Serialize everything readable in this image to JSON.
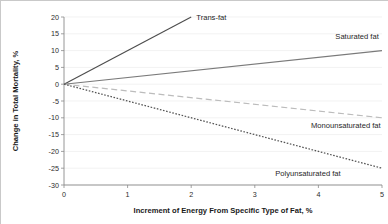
{
  "chart_data": {
    "type": "line",
    "title": "",
    "xlabel": "Increment of Energy From Specific Type of Fat, %",
    "ylabel": "Change in Total Mortality, %",
    "xlim": [
      0,
      5
    ],
    "ylim": [
      -30,
      20
    ],
    "xticks": [
      "0",
      "1",
      "2",
      "3",
      "4",
      "5"
    ],
    "yticks": [
      "20",
      "15",
      "10",
      "5",
      "0",
      "-5",
      "-10",
      "-15",
      "-20",
      "-25",
      "-30"
    ],
    "grid": true,
    "legend_position": "inline-labels",
    "series": [
      {
        "name": "Trans-fat",
        "x": [
          0,
          2
        ],
        "values": [
          0,
          20
        ],
        "style": "solid",
        "color": "#4d4d4d",
        "label_x": 2.08,
        "label_y": 19.2,
        "anchor": "start"
      },
      {
        "name": "Saturated fat",
        "x": [
          0,
          5
        ],
        "values": [
          0,
          10
        ],
        "style": "solid",
        "color": "#7a7a7a",
        "label_x": 4.95,
        "label_y": 13.4,
        "anchor": "end"
      },
      {
        "name": "Monounsaturated fat",
        "x": [
          0,
          5
        ],
        "values": [
          0,
          -10
        ],
        "style": "dashed",
        "color": "#bcbcbc",
        "label_x": 4.98,
        "label_y": -13.0,
        "anchor": "end"
      },
      {
        "name": "Polyunsaturated fat",
        "x": [
          0,
          5
        ],
        "values": [
          0,
          -25
        ],
        "style": "dotted",
        "color": "#545454",
        "label_x": 4.35,
        "label_y": -27.3,
        "anchor": "end"
      }
    ]
  }
}
